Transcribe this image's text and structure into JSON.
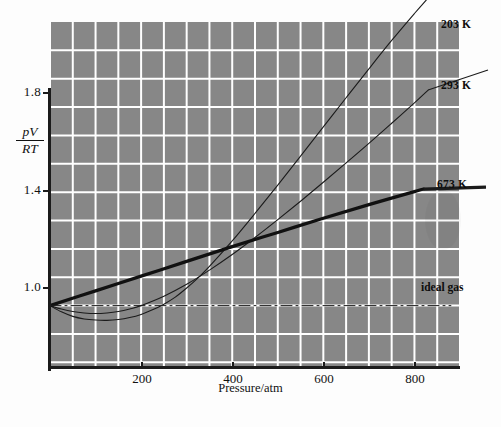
{
  "chart_data": {
    "type": "line",
    "title": "",
    "xlabel": "Pressure/atm",
    "ylabel": "pV/RT",
    "ylabel_numerator": "pV",
    "ylabel_denominator": "RT",
    "xlim": [
      0,
      900
    ],
    "ylim": [
      0.78,
      2.0
    ],
    "grid": true,
    "grid_color": "#ffffff",
    "plot_bg": "#878787",
    "legend_position": "inline-right-of-curve-ends",
    "xticks": [
      200,
      400,
      600,
      800
    ],
    "xtick_labels": [
      "200",
      "400",
      "600",
      "800"
    ],
    "yticks": [
      1.0,
      1.4,
      1.8
    ],
    "ytick_labels": [
      "1.0",
      "1.4",
      "1.8"
    ],
    "annotations": [
      "203 K",
      "293 K",
      "673 K",
      "ideal gas"
    ],
    "series": [
      {
        "name": "203 K",
        "label": "203 K",
        "color": "#1b1b1b",
        "width": 1.1,
        "style": "solid",
        "x": [
          0,
          25,
          50,
          75,
          100,
          125,
          150,
          175,
          200,
          225,
          250,
          275,
          300,
          325,
          350,
          400,
          450,
          500,
          550,
          600,
          650,
          700,
          750,
          800,
          830
        ],
        "y": [
          1.0,
          0.978,
          0.962,
          0.953,
          0.949,
          0.948,
          0.951,
          0.958,
          0.969,
          0.985,
          1.005,
          1.03,
          1.062,
          1.098,
          1.138,
          1.228,
          1.325,
          1.425,
          1.527,
          1.63,
          1.733,
          1.835,
          1.935,
          2.03,
          2.085
        ]
      },
      {
        "name": "293 K",
        "label": "293 K",
        "color": "#1b1b1b",
        "width": 1.1,
        "style": "solid",
        "x": [
          0,
          25,
          50,
          75,
          100,
          125,
          150,
          175,
          200,
          250,
          300,
          350,
          400,
          450,
          500,
          550,
          600,
          650,
          700,
          750,
          800,
          830
        ],
        "y": [
          1.0,
          0.988,
          0.979,
          0.974,
          0.972,
          0.974,
          0.979,
          0.988,
          1.0,
          1.033,
          1.075,
          1.125,
          1.18,
          1.24,
          1.303,
          1.368,
          1.435,
          1.503,
          1.572,
          1.643,
          1.715,
          1.76
        ]
      },
      {
        "name": "673 K",
        "label": "673 K",
        "color": "#111111",
        "width": 3.2,
        "style": "solid",
        "x": [
          0,
          100,
          200,
          300,
          400,
          500,
          600,
          700,
          800,
          820
        ],
        "y": [
          1.0,
          1.052,
          1.104,
          1.156,
          1.208,
          1.258,
          1.308,
          1.356,
          1.402,
          1.411
        ]
      },
      {
        "name": "ideal gas",
        "label": "ideal gas",
        "color": "#1b1b1b",
        "width": 1.0,
        "style": "dash-dot",
        "x": [
          0,
          880
        ],
        "y": [
          1.0,
          1.0
        ]
      }
    ]
  },
  "axis": {
    "x_title": "Pressure/atm"
  },
  "labels": {
    "s203": "203 K",
    "s293": "293 K",
    "s673": "673 K",
    "ideal": "ideal gas",
    "y_num": "pV",
    "y_den": "RT",
    "x0": "200",
    "x1": "400",
    "x2": "600",
    "x3": "800",
    "y0": "1.0",
    "y1": "1.4",
    "y2": "1.8"
  }
}
